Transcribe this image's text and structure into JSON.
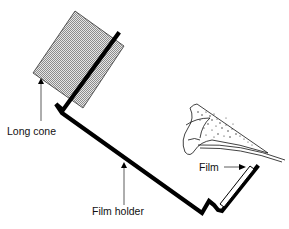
{
  "diagram": {
    "labels": {
      "long_cone": "Long cone",
      "film_holder": "Film holder",
      "film": "Film"
    },
    "colors": {
      "line": "#000000",
      "cone_fill": "#bdbdbd",
      "background": "#ffffff"
    }
  }
}
